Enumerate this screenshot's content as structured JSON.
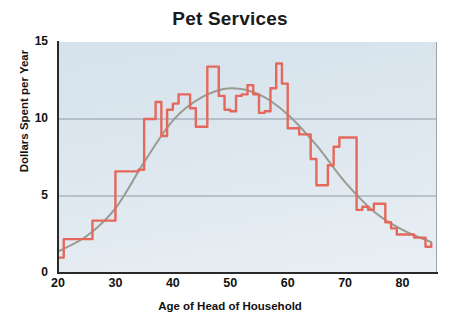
{
  "chart_data": {
    "type": "line",
    "title": "Pet Services",
    "xlabel": "Age of Head of Household",
    "ylabel": "Dollars Spent per Year",
    "xlim": [
      20,
      86
    ],
    "ylim": [
      0,
      15
    ],
    "xticks": [
      20,
      30,
      40,
      50,
      60,
      70,
      80
    ],
    "yticks": [
      0,
      5,
      10,
      15
    ],
    "grid": true,
    "gridlines_y": [
      5,
      10
    ],
    "legend": "none",
    "colors": {
      "data_line": "#e4695c",
      "trend_line": "#9a9a91",
      "plot_background": "#dde7ef",
      "axis": "#2a2a2a",
      "gridline": "#8f9aa6"
    },
    "series": [
      {
        "name": "Dollars Spent per Year",
        "style": "stepped-line",
        "color": "#e4695c",
        "x": [
          20,
          21,
          22,
          23,
          24,
          25,
          26,
          27,
          28,
          29,
          30,
          31,
          32,
          33,
          34,
          35,
          36,
          37,
          38,
          39,
          40,
          41,
          42,
          43,
          44,
          45,
          46,
          47,
          48,
          49,
          50,
          51,
          52,
          53,
          54,
          55,
          56,
          57,
          58,
          59,
          60,
          61,
          62,
          63,
          64,
          65,
          66,
          67,
          68,
          69,
          70,
          71,
          72,
          73,
          74,
          75,
          76,
          77,
          78,
          79,
          80,
          81,
          82,
          83,
          84,
          85
        ],
        "values": [
          1.0,
          2.2,
          2.2,
          2.2,
          2.2,
          2.2,
          3.4,
          3.4,
          3.4,
          3.4,
          6.6,
          6.6,
          6.6,
          6.6,
          6.7,
          10.0,
          10.0,
          11.1,
          8.9,
          10.6,
          11.0,
          11.6,
          11.6,
          10.7,
          9.5,
          9.5,
          13.4,
          13.4,
          11.5,
          10.6,
          10.5,
          11.5,
          11.6,
          12.2,
          11.6,
          10.4,
          10.5,
          12.0,
          13.6,
          12.3,
          9.4,
          9.4,
          9.0,
          9.0,
          7.4,
          5.7,
          5.7,
          7.0,
          8.2,
          8.8,
          8.8,
          8.8,
          4.1,
          4.3,
          4.1,
          4.5,
          4.5,
          3.3,
          2.9,
          2.5,
          2.5,
          2.5,
          2.3,
          2.3,
          1.7,
          1.9
        ]
      },
      {
        "name": "Trend (fitted curve)",
        "style": "smooth-curve",
        "color": "#9a9a91",
        "x": [
          20,
          25,
          30,
          35,
          40,
          45,
          50,
          55,
          60,
          65,
          70,
          75,
          80,
          85
        ],
        "values": [
          1.4,
          2.4,
          4.2,
          7.2,
          9.9,
          11.4,
          12.0,
          11.6,
          10.3,
          8.3,
          5.9,
          4.0,
          2.8,
          2.0
        ]
      }
    ]
  },
  "axis_labels": {
    "y": "Dollars Spent per Year",
    "x": "Age of Head of Household"
  }
}
